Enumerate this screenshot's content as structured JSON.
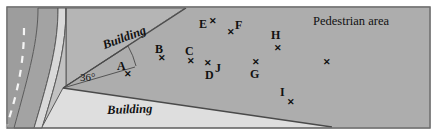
{
  "figure": {
    "name": "pedestrian-area-site-plan",
    "frame": {
      "border_color": "#6e6e6e",
      "background": "#ffffff"
    },
    "regions": {
      "pedestrian_area": {
        "label": "Pedestrian area",
        "fill": "#a9a9a9"
      },
      "building_top": {
        "label": "Building",
        "fill": "#bdbdbd"
      },
      "building_bottom": {
        "label": "Building",
        "fill": "#d6d6d6"
      },
      "road_surface": {
        "fill": "#9e9e9e"
      },
      "sidewalk": {
        "fill": "#cfcfcf"
      },
      "road_markings": {
        "label": "dashed-center-line",
        "color": "#f2f2f2"
      }
    },
    "angle": {
      "value": "36",
      "unit": "°",
      "text": "36°"
    },
    "points": [
      {
        "id": "A",
        "label": "A",
        "label_x": 117,
        "label_y": 60,
        "marker_x": 124,
        "marker_y": 70
      },
      {
        "id": "B",
        "label": "B",
        "label_x": 155,
        "label_y": 43,
        "marker_x": 158,
        "marker_y": 54
      },
      {
        "id": "C",
        "label": "C",
        "label_x": 185,
        "label_y": 45,
        "marker_x": 187,
        "marker_y": 57
      },
      {
        "id": "D",
        "label": "D",
        "label_x": 205,
        "label_y": 69,
        "marker_x": 204,
        "marker_y": 59
      },
      {
        "id": "E",
        "label": "E",
        "label_x": 199,
        "label_y": 18,
        "marker_x": 209,
        "marker_y": 17
      },
      {
        "id": "F",
        "label": "F",
        "label_x": 235,
        "label_y": 19,
        "marker_x": 227,
        "marker_y": 28
      },
      {
        "id": "G",
        "label": "G",
        "label_x": 250,
        "label_y": 68,
        "marker_x": 252,
        "marker_y": 58
      },
      {
        "id": "H",
        "label": "H",
        "label_x": 271,
        "label_y": 29,
        "marker_x": 274,
        "marker_y": 44
      },
      {
        "id": "I",
        "label": "I",
        "label_x": 280,
        "label_y": 86,
        "marker_x": 287,
        "marker_y": 98
      },
      {
        "id": "J",
        "label": "J",
        "label_x": 215,
        "label_y": 62,
        "marker_x": 204,
        "marker_y": 59
      },
      {
        "id": "unlabeled",
        "label": "",
        "label_x": 0,
        "label_y": 0,
        "marker_x": 323,
        "marker_y": 58
      }
    ]
  }
}
